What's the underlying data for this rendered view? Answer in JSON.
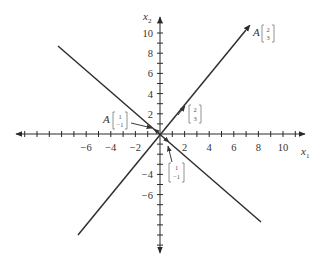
{
  "diagram": {
    "axes": {
      "x_label": "x",
      "x_subscript": "1",
      "y_label": "x",
      "y_subscript": "2",
      "x_ticks": [
        -6,
        -4,
        -2,
        2,
        4,
        6,
        8,
        10
      ],
      "x_tick_labels": [
        "−6",
        "−4",
        "−2",
        "2",
        "4",
        "6",
        "8",
        "10"
      ],
      "y_ticks": [
        10,
        8,
        6,
        4,
        2,
        -4,
        -6
      ],
      "y_tick_labels": [
        "10",
        "8",
        "6",
        "4",
        "2",
        "−4",
        "−6"
      ],
      "x_range": [
        -11.5,
        11.5
      ],
      "y_range": [
        -11.5,
        11.5
      ]
    },
    "lines": [
      {
        "name": "span-of-2-3",
        "direction": [
          2,
          3
        ]
      },
      {
        "name": "span-of-1-neg1",
        "direction": [
          1,
          -1
        ]
      }
    ],
    "vectors": [
      {
        "name": "v-2-3",
        "label_prefix": "",
        "top": "2",
        "bottom": "3",
        "to": [
          2,
          3
        ]
      },
      {
        "name": "A-v-2-3",
        "label_prefix": "A",
        "top": "2",
        "bottom": "3",
        "to": [
          7.5,
          11.25
        ]
      },
      {
        "name": "v-1-neg1",
        "label_prefix": "",
        "top": "1",
        "bottom": "−1",
        "to": [
          1,
          -1
        ]
      },
      {
        "name": "A-v-1-neg1",
        "label_prefix": "A",
        "top": "1",
        "bottom": "−1",
        "to": [
          -0.5,
          0.5
        ]
      }
    ]
  }
}
